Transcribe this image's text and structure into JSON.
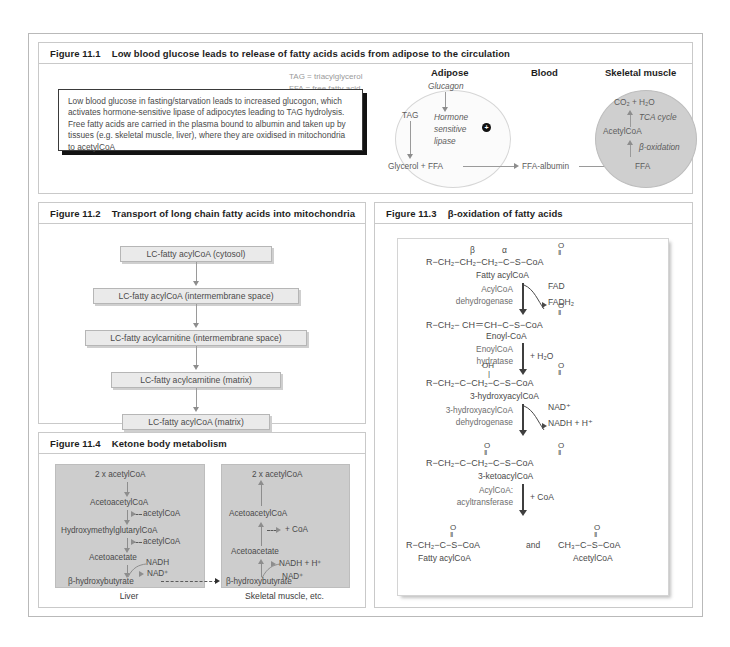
{
  "figures": {
    "f1": {
      "number": "Figure 11.1",
      "title": "Low blood glucose leads to release of fatty acids acids from adipose to the circulation",
      "legend": [
        "TAG = triacylglycerol",
        "FFA = free fatty acid"
      ],
      "summary": "Low blood glucose in fasting/starvation leads to increased glucogon, which activates hormone-sensitive lipase of adipocytes leading to TAG hydrolysis. Free fatty acids are carried in the plasma bound to albumin and taken up by tissues (e.g. skeletal muscle, liver), where they are oxidised in mitochondria to acetylCoA",
      "columns": [
        "Adipose",
        "Blood",
        "Skeletal muscle"
      ],
      "adipose": {
        "hormone": "Glucagon",
        "substrate": "TAG",
        "enzyme_l1": "Hormone",
        "enzyme_l2": "sensitive",
        "enzyme_l3": "lipase",
        "activation": "+",
        "products": "Glycerol + FFA"
      },
      "blood": {
        "carrier": "FFA-albumin"
      },
      "muscle": {
        "uptake": "FFA",
        "step1": "β-oxidation",
        "intermediate": "AcetylCoA",
        "step2": "TCA cycle",
        "endproducts": "CO₂ + H₂O"
      }
    },
    "f2": {
      "number": "Figure 11.2",
      "title": "Transport of long chain fatty acids into mitochondria",
      "steps": [
        "LC-fatty acylCoA (cytosol)",
        "LC-fatty acylCoA (intermembrane space)",
        "LC-fatty acylcarnitine (intermembrane space)",
        "LC-fatty acylcarnitine (matrix)",
        "LC-fatty acylCoA (matrix)"
      ]
    },
    "f3": {
      "number": "Figure 11.3",
      "title": "β-oxidation of fatty acids",
      "beta_label": "β",
      "alpha_label": "α",
      "structures": [
        {
          "formula": "R−CH₂−CH₂−CH₂−C−S−CoA",
          "name": "Fatty acylCoA",
          "top_atom": "O",
          "bond": "‖"
        },
        {
          "formula": "R−CH₂− CH＝CH−C−S−CoA",
          "name": "Enoyl-CoA",
          "top_atom": "O",
          "bond": "‖"
        },
        {
          "formula": "R−CH₂−C−CH₂−C−S−CoA",
          "name": "3-hydroxyacylCoA",
          "top_atom": "OH",
          "bond": "‖"
        },
        {
          "formula": "R−CH₂−C−CH₂−C−S−CoA",
          "name": "3-ketoacylCoA",
          "top_atom": "O",
          "bond": "‖"
        }
      ],
      "final_left": {
        "formula": "R−CH₂−C−S−CoA",
        "name": "Fatty acylCoA"
      },
      "final_conj": "and",
      "final_right": {
        "formula": "CH₃−C−S−CoA",
        "name": "AcetylCoA"
      },
      "enzymes": [
        {
          "l1": "AcylCoA",
          "l2": "dehydrogenase",
          "in": "FAD",
          "out": "FADH₂"
        },
        {
          "l1": "EnoylCoA",
          "l2": "hydratase",
          "in": "+ H₂O",
          "out": ""
        },
        {
          "l1": "3-hydroxyacylCoA",
          "l2": "dehydrogenase",
          "in": "NAD⁺",
          "out": "NADH + H⁺"
        },
        {
          "l1": "AcylCoA:",
          "l2": "acyltransferase",
          "in": "+ CoA",
          "out": ""
        }
      ]
    },
    "f4": {
      "number": "Figure 11.4",
      "title": "Ketone body metabolism",
      "liver": {
        "caption": "Liver",
        "nodes": [
          "2 x acetylCoA",
          "AcetoacetylCoA",
          "HydroxymethylglutarylCoA",
          "Acetoacetate",
          "β-hydroxybutyrate"
        ],
        "side1": "acetylCoA",
        "side2": "acetylCoA",
        "cof_in": "NADH",
        "cof_out": "NAD⁺"
      },
      "muscle": {
        "caption": "Skeletal muscle, etc.",
        "nodes": [
          "2 x acetylCoA",
          "AcetoacetylCoA",
          "Acetoacetate",
          "β-hydroxybutyrate"
        ],
        "side1": "+ CoA",
        "cof_out": "NADH + H⁺",
        "cof_in": "NAD⁺"
      }
    }
  }
}
